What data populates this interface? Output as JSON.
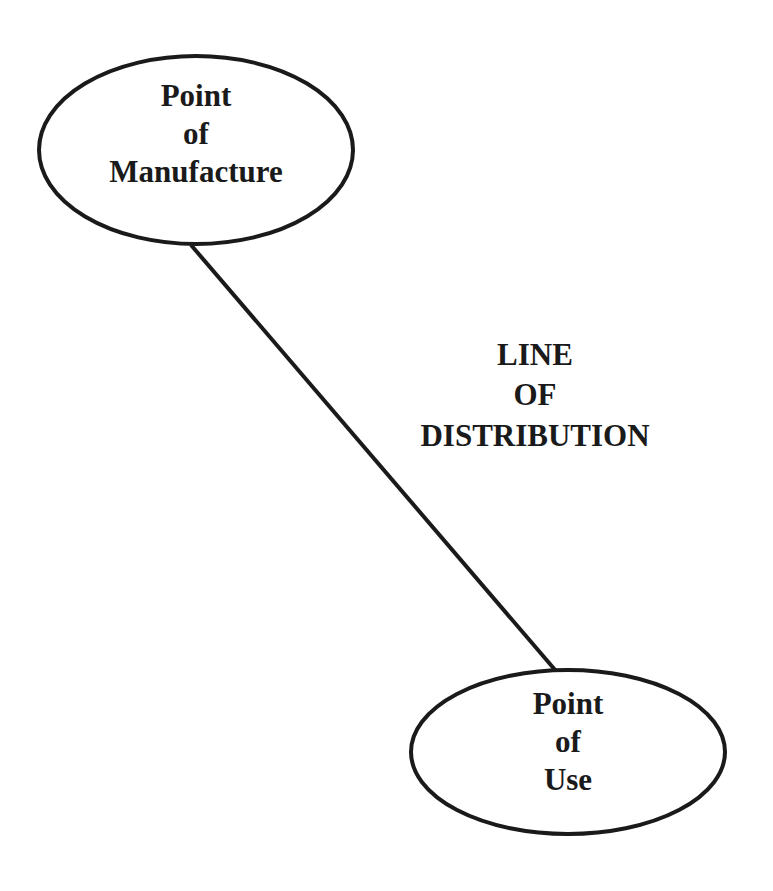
{
  "diagram": {
    "nodes": [
      {
        "id": "manufacture",
        "lines": [
          "Point",
          "of",
          "Manufacture"
        ]
      },
      {
        "id": "use",
        "lines": [
          "Point",
          "of",
          "Use"
        ]
      }
    ],
    "edge": {
      "from": "manufacture",
      "to": "use",
      "label_lines": [
        "LINE",
        "OF",
        "DISTRIBUTION"
      ]
    },
    "colors": {
      "stroke": "#1a1a1a",
      "background": "#ffffff"
    }
  }
}
